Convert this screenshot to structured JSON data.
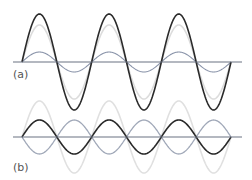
{
  "figure": {
    "panels": [
      {
        "id": "a",
        "label": "(a)",
        "axis_y": 62,
        "axis_x_start": 13,
        "axis_x_end": 242,
        "wave_x_start": 22,
        "wave_x_end": 231,
        "periods": 3,
        "curves": [
          {
            "name": "light-gray-wave",
            "amplitude": 37,
            "phase_sign": 1,
            "color": "#dcdcdc",
            "width": 1.6
          },
          {
            "name": "blue-gray-wave",
            "amplitude": 10,
            "phase_sign": 1,
            "color": "#8892a8",
            "width": 1.1
          },
          {
            "name": "black-resultant-wave",
            "amplitude": 48,
            "phase_sign": 1,
            "color": "#2a2a2a",
            "width": 1.6
          }
        ]
      },
      {
        "id": "b",
        "label": "(b)",
        "axis_y": 137,
        "axis_x_start": 13,
        "axis_x_end": 242,
        "wave_x_start": 22,
        "wave_x_end": 231,
        "periods": 3,
        "curves": [
          {
            "name": "light-gray-wave",
            "amplitude": 36,
            "phase_sign": 1,
            "color": "#e0e0e0",
            "width": 1.6
          },
          {
            "name": "blue-gray-wave",
            "amplitude": 17,
            "phase_sign": -1,
            "color": "#a0a8b8",
            "width": 1.3
          },
          {
            "name": "black-wave",
            "amplitude": 17,
            "phase_sign": 1,
            "color": "#2a2a2a",
            "width": 1.6
          }
        ]
      }
    ],
    "axis_color": "#6a7282"
  },
  "labels": {
    "a": "(a)",
    "b": "(b)"
  }
}
